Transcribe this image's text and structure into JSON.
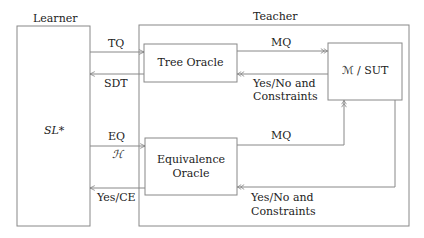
{
  "diagram": {
    "learner": {
      "title": "Learner",
      "algorithm": "SL*"
    },
    "teacher": {
      "title": "Teacher"
    },
    "tree_oracle": {
      "label": "Tree Oracle"
    },
    "equivalence_oracle": {
      "line1": "Equivalence",
      "line2": "Oracle"
    },
    "sut": {
      "label": "ℳ / SUT"
    },
    "edges": {
      "tq": "TQ",
      "sdt": "SDT",
      "eq": "EQ",
      "hypothesis": "ℋ",
      "yes_ce": "Yes/CE",
      "mq_tree": "MQ",
      "mq_eq": "MQ",
      "yesno_tree_1": "Yes/No and",
      "yesno_tree_2": "Constraints",
      "yesno_eq_1": "Yes/No and",
      "yesno_eq_2": "Constraints"
    }
  }
}
